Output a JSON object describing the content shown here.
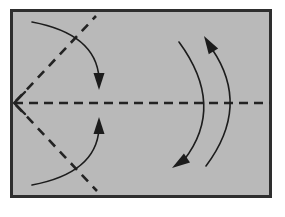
{
  "figure": {
    "background_color": "#ffffff",
    "panel": {
      "name": "diagram-panel",
      "fill_color": "#b9b9b9",
      "border_color": "#2e2e2e",
      "border_width": 3,
      "x": 10,
      "y": 9,
      "width": 262,
      "height": 189
    },
    "axis": {
      "name": "optical-axis",
      "style": "dashed",
      "color": "#232323",
      "stroke_width": 2.6,
      "dash_length": 9,
      "gap_length": 6,
      "y": 103,
      "x_start": 14,
      "x_end": 270,
      "arrow_direction": "left",
      "arrow_style": "open-v",
      "arrow_tip_x": 14,
      "arrow_tip_y": 103
    },
    "dashed_rays": [
      {
        "name": "upper-dashed-ray",
        "style": "dashed",
        "color": "#232323",
        "from_x": 16,
        "from_y": 101,
        "to_x": 96,
        "to_y": 16
      },
      {
        "name": "lower-dashed-ray",
        "style": "dashed",
        "color": "#232323",
        "from_x": 16,
        "from_y": 105,
        "to_x": 97,
        "to_y": 191
      }
    ],
    "left_arcs": [
      {
        "name": "upper-left-converging-arc",
        "style": "solid",
        "color": "#1c1c1c",
        "stroke_width": 1.6,
        "start_x": 32,
        "start_y": 22,
        "control_x": 96,
        "control_y": 34,
        "end_x": 99,
        "end_y": 78,
        "arrow": "filled-triangle",
        "arrow_tip_x": 99,
        "arrow_tip_y": 90,
        "arrow_direction": "down"
      },
      {
        "name": "lower-left-converging-arc",
        "style": "solid",
        "color": "#1c1c1c",
        "stroke_width": 1.6,
        "start_x": 32,
        "start_y": 185,
        "control_x": 96,
        "control_y": 173,
        "end_x": 99,
        "end_y": 129,
        "arrow": "filled-triangle",
        "arrow_tip_x": 99,
        "arrow_tip_y": 117,
        "arrow_direction": "up"
      }
    ],
    "right_arcs": [
      {
        "name": "inner-right-arc",
        "style": "solid",
        "color": "#1c1c1c",
        "stroke_width": 1.6,
        "start_x": 179,
        "start_y": 42,
        "control_x": 226,
        "control_y": 106,
        "end_x": 184,
        "end_y": 160,
        "arrow": "filled-triangle",
        "arrow_tip_x": 172,
        "arrow_tip_y": 168,
        "arrow_direction": "down-left"
      },
      {
        "name": "outer-right-arc",
        "style": "solid",
        "color": "#1c1c1c",
        "stroke_width": 1.6,
        "start_x": 206,
        "start_y": 166,
        "control_x": 251,
        "control_y": 106,
        "end_x": 212,
        "end_y": 49,
        "arrow": "filled-triangle",
        "arrow_tip_x": 204,
        "arrow_tip_y": 36,
        "arrow_direction": "up-left"
      }
    ]
  }
}
